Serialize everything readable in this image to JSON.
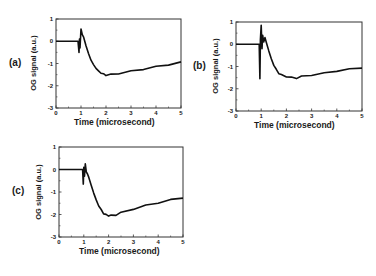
{
  "chart_data": [
    {
      "type": "line",
      "panel_label": "(a)",
      "title": "",
      "xlabel": "Time (microsecond)",
      "ylabel": "OG signal (a.u.)",
      "xlim": [
        0,
        5
      ],
      "ylim": [
        -3,
        1
      ],
      "xticks": [
        0,
        1,
        2,
        3,
        4,
        5
      ],
      "yticks": [
        1,
        0,
        -1,
        -2,
        -3
      ],
      "grid": false,
      "legend": null,
      "series": [
        {
          "name": "OG signal (a)",
          "x": [
            0,
            0.5,
            0.88,
            0.92,
            0.94,
            0.96,
            1.0,
            1.05,
            1.1,
            1.2,
            1.3,
            1.4,
            1.5,
            1.6,
            1.7,
            1.8,
            1.9,
            2.0,
            2.2,
            2.5,
            3.0,
            3.5,
            4.0,
            4.5,
            5.0
          ],
          "y": [
            0,
            0,
            0,
            -0.5,
            0.1,
            -0.3,
            0.55,
            0.3,
            0.2,
            -0.2,
            -0.55,
            -0.85,
            -1.05,
            -1.2,
            -1.35,
            -1.42,
            -1.48,
            -1.52,
            -1.5,
            -1.45,
            -1.35,
            -1.25,
            -1.15,
            -1.05,
            -0.95
          ]
        }
      ]
    },
    {
      "type": "line",
      "panel_label": "(b)",
      "title": "",
      "xlabel": "Time (microsecond)",
      "ylabel": "OG signal (a.u.)",
      "xlim": [
        0,
        5
      ],
      "ylim": [
        -3,
        1
      ],
      "xticks": [
        0,
        1,
        2,
        3,
        4,
        5
      ],
      "yticks": [
        1,
        0,
        -1,
        -2,
        -3
      ],
      "grid": false,
      "legend": null,
      "series": [
        {
          "name": "OG signal (b)",
          "x": [
            0,
            0.5,
            0.92,
            0.95,
            0.97,
            1.0,
            1.03,
            1.06,
            1.1,
            1.15,
            1.2,
            1.3,
            1.4,
            1.5,
            1.6,
            1.7,
            1.8,
            2.0,
            2.2,
            2.4,
            2.6,
            3.0,
            3.5,
            4.0,
            4.5,
            5.0
          ],
          "y": [
            0,
            0,
            0,
            -1.55,
            0.2,
            0.85,
            -0.2,
            0.4,
            0.1,
            0.3,
            0.1,
            -0.3,
            -0.65,
            -0.95,
            -1.15,
            -1.3,
            -1.38,
            -1.45,
            -1.5,
            -1.52,
            -1.45,
            -1.38,
            -1.3,
            -1.2,
            -1.12,
            -1.05
          ]
        }
      ]
    },
    {
      "type": "line",
      "panel_label": "(c)",
      "title": "",
      "xlabel": "Time (microsecond)",
      "ylabel": "OG signal (a.u.)",
      "xlim": [
        0,
        5
      ],
      "ylim": [
        -3,
        1
      ],
      "xticks": [
        0,
        1,
        2,
        3,
        4,
        5
      ],
      "yticks": [
        1,
        0,
        -1,
        -2,
        -3
      ],
      "grid": false,
      "legend": null,
      "series": [
        {
          "name": "OG signal (c)",
          "x": [
            0,
            0.5,
            0.95,
            0.98,
            1.0,
            1.03,
            1.06,
            1.1,
            1.15,
            1.2,
            1.3,
            1.4,
            1.5,
            1.6,
            1.7,
            1.8,
            1.9,
            2.0,
            2.1,
            2.3,
            2.5,
            3.0,
            3.5,
            4.0,
            4.5,
            5.0
          ],
          "y": [
            0,
            0,
            0,
            -0.65,
            0.1,
            -0.3,
            0.25,
            -0.1,
            -0.2,
            -0.35,
            -0.7,
            -1.05,
            -1.35,
            -1.6,
            -1.8,
            -1.95,
            -2.02,
            -2.05,
            -2.05,
            -2.02,
            -1.92,
            -1.75,
            -1.6,
            -1.48,
            -1.35,
            -1.25
          ]
        }
      ]
    }
  ],
  "panels": [
    {
      "label": "(a)",
      "xlabel": "Time (microsecond)",
      "ylabel": "OG signal (a.u.)"
    },
    {
      "label": "(b)",
      "xlabel": "Time (microsecond)",
      "ylabel": "OG signal (a.u.)"
    },
    {
      "label": "(c)",
      "xlabel": "Time (microsecond)",
      "ylabel": "OG signal (a.u.)"
    }
  ]
}
